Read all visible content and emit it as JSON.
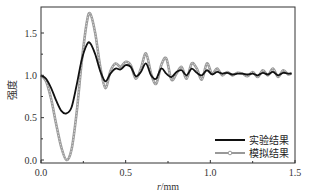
{
  "chart_data": {
    "type": "line",
    "title": "",
    "xlabel": "r/mm",
    "ylabel": "强度",
    "xlim": [
      0.0,
      1.5
    ],
    "ylim": [
      -0.05,
      1.8
    ],
    "xticks": [
      "0.0",
      "0.5",
      "1.0",
      "1.5"
    ],
    "yticks": [
      "0.0",
      "0.5",
      "1.0",
      "1.5"
    ],
    "grid": false,
    "legend_position": "lower right",
    "x": [
      0.0,
      0.03,
      0.06,
      0.09,
      0.12,
      0.15,
      0.18,
      0.21,
      0.24,
      0.27,
      0.29,
      0.32,
      0.35,
      0.38,
      0.41,
      0.44,
      0.47,
      0.5,
      0.53,
      0.56,
      0.59,
      0.62,
      0.65,
      0.68,
      0.71,
      0.74,
      0.77,
      0.8,
      0.83,
      0.86,
      0.89,
      0.92,
      0.95,
      0.98,
      1.01,
      1.04,
      1.07,
      1.1,
      1.13,
      1.16,
      1.19,
      1.22,
      1.25,
      1.28,
      1.31,
      1.34,
      1.37,
      1.4,
      1.43,
      1.46,
      1.48
    ],
    "series": [
      {
        "name": "实验结果",
        "color": "#111111",
        "values": [
          1.0,
          0.96,
          0.85,
          0.7,
          0.58,
          0.55,
          0.62,
          0.88,
          1.18,
          1.36,
          1.38,
          1.25,
          1.05,
          0.93,
          1.02,
          1.08,
          1.07,
          1.12,
          1.1,
          0.99,
          1.04,
          1.14,
          1.0,
          0.96,
          1.08,
          1.02,
          0.98,
          1.04,
          1.06,
          1.0,
          1.08,
          1.03,
          1.0,
          1.06,
          1.01,
          1.04,
          1.02,
          1.03,
          1.01,
          1.02,
          1.02,
          1.01,
          1.02,
          1.0,
          1.03,
          1.01,
          1.04,
          1.0,
          1.03,
          1.02,
          1.02
        ]
      },
      {
        "name": "模拟结果",
        "color": "#999999",
        "values": [
          1.0,
          0.93,
          0.72,
          0.42,
          0.15,
          0.0,
          0.12,
          0.55,
          1.15,
          1.62,
          1.73,
          1.5,
          1.1,
          0.85,
          1.05,
          1.14,
          1.1,
          1.16,
          1.12,
          0.96,
          1.08,
          1.26,
          1.02,
          0.9,
          1.12,
          1.2,
          0.95,
          1.02,
          1.1,
          0.96,
          1.14,
          1.08,
          0.95,
          1.14,
          1.02,
          1.08,
          1.0,
          1.04,
          1.0,
          1.03,
          1.02,
          0.99,
          1.04,
          0.98,
          1.06,
          1.0,
          1.08,
          0.98,
          1.06,
          1.01,
          1.03
        ]
      }
    ]
  },
  "legend": {
    "items": [
      {
        "label": "实验结果",
        "style": "solid-black"
      },
      {
        "label": "模拟结果",
        "style": "gray-markers"
      }
    ]
  }
}
